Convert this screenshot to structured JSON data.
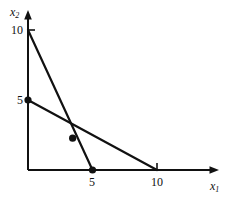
{
  "figure": {
    "background_color": "#ffffff",
    "ink_color": "#111111"
  },
  "axes": {
    "x_axis_label": "x",
    "x_axis_subscript": "1",
    "y_axis_label": "x",
    "y_axis_subscript": "2",
    "x_tick_labels": [
      "5",
      "10"
    ],
    "y_tick_labels": [
      "5",
      "10"
    ]
  },
  "chart_data": {
    "type": "line",
    "title": "",
    "subtitle": "",
    "xlabel": "x1",
    "ylabel": "x2",
    "xlim": [
      0,
      14.7
    ],
    "ylim": [
      0,
      11.4
    ],
    "xticks": [
      5,
      10
    ],
    "yticks": [
      5,
      10
    ],
    "xtick_labels": [
      "5",
      "10"
    ],
    "ytick_labels": [
      "5",
      "10"
    ],
    "grid": false,
    "legend": null,
    "legend_position": "none",
    "axis_style": "two-spine-with-arrows",
    "series": [
      {
        "name": "constraint-line-steep",
        "x": [
          0,
          5
        ],
        "y": [
          10,
          0
        ],
        "color": "#111111",
        "width": 2.2
      },
      {
        "name": "constraint-line-shallow",
        "x": [
          0,
          10
        ],
        "y": [
          5,
          0
        ],
        "color": "#111111",
        "width": 2.2
      }
    ],
    "points": [
      {
        "name": "y-intercept-vertex",
        "x": 0,
        "y": 5,
        "marker": "filled-circle"
      },
      {
        "name": "intersection-vertex",
        "x": 3.46,
        "y": 2.27,
        "marker": "filled-circle"
      },
      {
        "name": "x-intercept-vertex",
        "x": 5,
        "y": 0,
        "marker": "filled-circle"
      }
    ],
    "annotations": []
  }
}
